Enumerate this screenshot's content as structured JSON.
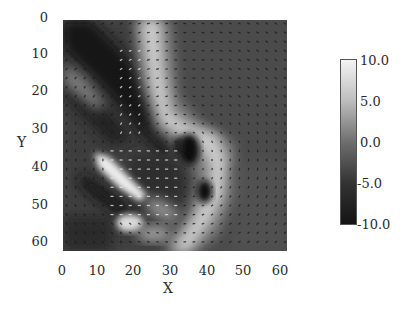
{
  "chart_data": {
    "type": "heatmap",
    "overlay": "vector-quiver",
    "title": "",
    "xlabel": "X",
    "ylabel": "Y",
    "xlim": [
      0,
      63
    ],
    "ylim": [
      63,
      0
    ],
    "x_ticks": [
      "0",
      "10",
      "20",
      "30",
      "40",
      "50",
      "60"
    ],
    "y_ticks": [
      "0",
      "10",
      "20",
      "30",
      "40",
      "50",
      "60"
    ],
    "grid": false,
    "colormap": "grayscale",
    "colorbar": {
      "min": -10.0,
      "max": 10.0,
      "ticks": [
        "10.0",
        "5.0",
        "0.0",
        "-5.0",
        "-10.0"
      ],
      "position": "right"
    },
    "grid_size": [
      64,
      64
    ],
    "features": [
      {
        "kind": "positive-band",
        "path": [
          [
            25,
            0
          ],
          [
            26,
            15
          ],
          [
            28,
            28
          ],
          [
            34,
            32
          ],
          [
            42,
            36
          ],
          [
            44,
            45
          ],
          [
            40,
            55
          ],
          [
            33,
            62
          ]
        ],
        "value": 9
      },
      {
        "kind": "negative-band",
        "path": [
          [
            2,
            2
          ],
          [
            12,
            12
          ],
          [
            20,
            22
          ],
          [
            26,
            32
          ],
          [
            30,
            38
          ]
        ],
        "value": -9
      },
      {
        "kind": "positive-streak",
        "path": [
          [
            10,
            40
          ],
          [
            16,
            45
          ],
          [
            22,
            50
          ]
        ],
        "value": 8
      },
      {
        "kind": "negative-eddy",
        "center": [
          35,
          38
        ],
        "value": -8
      },
      {
        "kind": "negative-eddy",
        "center": [
          40,
          48
        ],
        "value": -9
      },
      {
        "kind": "positive-patch",
        "center": [
          18,
          57
        ],
        "value": 7
      }
    ]
  },
  "axes": {
    "x_label": "X",
    "y_label": "Y",
    "x_ticks": [
      "0",
      "10",
      "20",
      "30",
      "40",
      "50",
      "60"
    ],
    "y_ticks": [
      "0",
      "10",
      "20",
      "30",
      "40",
      "50",
      "60"
    ]
  },
  "colorbar": {
    "ticks": [
      "10.0",
      "5.0",
      "0.0",
      "-5.0",
      "-10.0"
    ]
  }
}
